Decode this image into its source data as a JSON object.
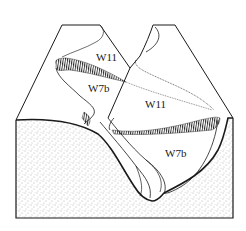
{
  "diagram": {
    "type": "geological block diagram",
    "labels": {
      "upper_left": "W11",
      "lower_left": "W7b",
      "upper_right": "W11",
      "lower_right": "W7b"
    },
    "colors": {
      "line": "#1a1a1a",
      "stipple": "#555555",
      "background": "#ffffff"
    }
  }
}
